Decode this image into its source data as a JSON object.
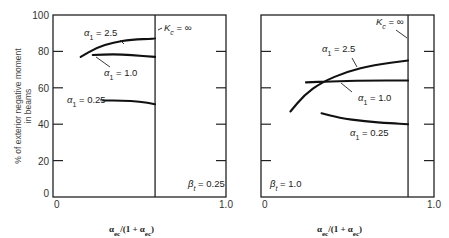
{
  "chart_data": [
    {
      "type": "line",
      "panel": "left",
      "title": "",
      "xlabel": "α_ec/(1 + α_ec)",
      "ylabel": "% of exterior negative moment in beams",
      "xlim": [
        0,
        1.0
      ],
      "ylim": [
        0,
        100
      ],
      "x_ticks": [
        "0",
        "1.0"
      ],
      "y_ticks": [
        "0",
        "20",
        "40",
        "60",
        "80",
        "100"
      ],
      "y_tick_values": [
        0,
        20,
        40,
        60,
        80,
        100
      ],
      "vertical_line": {
        "x": 0.59,
        "label": "K_c = ∞"
      },
      "annotation": "β_t = 0.25",
      "series": [
        {
          "name": "α₁ = 2.5",
          "x": [
            0.16,
            0.25,
            0.35,
            0.45,
            0.59
          ],
          "y": [
            77,
            82,
            85,
            86.5,
            87
          ]
        },
        {
          "name": "α₁ = 1.0",
          "x": [
            0.23,
            0.35,
            0.45,
            0.59
          ],
          "y": [
            78,
            78.5,
            78,
            77
          ]
        },
        {
          "name": "α₁ = 0.25",
          "x": [
            0.29,
            0.4,
            0.5,
            0.59
          ],
          "y": [
            53,
            53,
            52.5,
            51
          ]
        }
      ]
    },
    {
      "type": "line",
      "panel": "right",
      "title": "",
      "xlabel": "α_ec/(1 + α_ec)",
      "ylabel": "",
      "xlim": [
        0,
        1.0
      ],
      "ylim": [
        0,
        100
      ],
      "x_ticks": [
        "0",
        "1.0"
      ],
      "y_tick_values": [
        0,
        20,
        40,
        60,
        80,
        100
      ],
      "vertical_line": {
        "x": 0.85,
        "label": "K_c = ∞"
      },
      "annotation": "β_t = 1.0",
      "series": [
        {
          "name": "α₁ = 2.5",
          "x": [
            0.17,
            0.25,
            0.35,
            0.5,
            0.65,
            0.85
          ],
          "y": [
            47,
            56,
            63,
            69,
            72.5,
            75
          ]
        },
        {
          "name": "α₁ = 1.0",
          "x": [
            0.26,
            0.4,
            0.6,
            0.85
          ],
          "y": [
            63,
            63.5,
            64,
            64
          ]
        },
        {
          "name": "α₁ = 0.25",
          "x": [
            0.35,
            0.45,
            0.6,
            0.75,
            0.85
          ],
          "y": [
            46,
            43.5,
            41.5,
            40.5,
            40
          ]
        }
      ]
    }
  ],
  "labels": {
    "ylabel_line1": "% of exterior negative moment",
    "ylabel_line2": "in beams",
    "alpha_prefix": "α",
    "alpha_sub": "1",
    "kc_text": "K",
    "kc_sub": "c",
    "kc_rest": " = ∞",
    "beta_prefix": "β",
    "beta_sub": "t",
    "xlabel_text": "α",
    "xlabel_sub": "ec",
    "xlabel_mid": "/(1 + α",
    "xlabel_sub2": "ec",
    "xlabel_end": ")"
  }
}
